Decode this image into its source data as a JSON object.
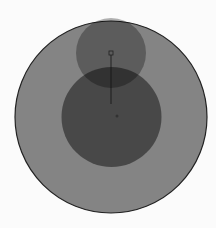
{
  "diagram": {
    "background": "#fbfbfb",
    "outer_circle": {
      "cx": 111,
      "cy": 117,
      "r": 96,
      "fill": "#848484",
      "stroke": "#222222"
    },
    "middle_circle": {
      "cx": 111.5,
      "cy": 117,
      "r": 50,
      "fill": "#000000",
      "opacity": 0.45
    },
    "top_circle": {
      "cx": 111,
      "cy": 53,
      "r": 35,
      "fill": "#000000",
      "opacity": 0.3
    },
    "marker": {
      "x": 109,
      "y": 51,
      "size": 4,
      "stroke": "#222222"
    },
    "guide_line": {
      "x1": 111,
      "y1": 55,
      "x2": 111,
      "y2": 104,
      "stroke": "#111111"
    },
    "center_dot": {
      "cx": 117,
      "cy": 116,
      "r": 1.5,
      "fill": "#2a2a2a"
    }
  }
}
